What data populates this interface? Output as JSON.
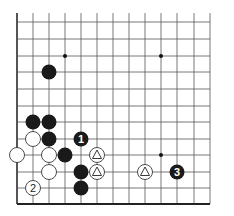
{
  "board": {
    "origin_x": 17,
    "origin_y": 22,
    "col_x": [
      17,
      33,
      49,
      65,
      81,
      97,
      113,
      129,
      145,
      161,
      177,
      194,
      210
    ],
    "row_y": [
      22,
      39,
      56,
      72,
      89,
      106,
      122,
      139,
      155,
      172,
      188,
      204
    ],
    "top_y": 13,
    "line_color": "#555555",
    "edge_color": "#222222"
  },
  "hoshi": [
    [
      3,
      2
    ],
    [
      9,
      2
    ],
    [
      9,
      8
    ]
  ],
  "stones": [
    {
      "c": 2,
      "r": 3,
      "color": "black",
      "label": ""
    },
    {
      "c": 1,
      "r": 6,
      "color": "black",
      "label": ""
    },
    {
      "c": 2,
      "r": 6,
      "color": "black",
      "label": ""
    },
    {
      "c": 1,
      "r": 7,
      "color": "white",
      "label": ""
    },
    {
      "c": 2,
      "r": 7,
      "color": "black",
      "label": ""
    },
    {
      "c": 4,
      "r": 7,
      "color": "black",
      "label": "1"
    },
    {
      "c": 0,
      "r": 8,
      "color": "white",
      "label": ""
    },
    {
      "c": 2,
      "r": 8,
      "color": "white",
      "label": ""
    },
    {
      "c": 3,
      "r": 8,
      "color": "black",
      "label": ""
    },
    {
      "c": 5,
      "r": 8,
      "color": "white",
      "label": "triangle"
    },
    {
      "c": 2,
      "r": 9,
      "color": "white",
      "label": ""
    },
    {
      "c": 4,
      "r": 9,
      "color": "black",
      "label": ""
    },
    {
      "c": 5,
      "r": 9,
      "color": "white",
      "label": "triangle"
    },
    {
      "c": 8,
      "r": 9,
      "color": "white",
      "label": "triangle"
    },
    {
      "c": 10,
      "r": 9,
      "color": "black",
      "label": "3"
    },
    {
      "c": 1,
      "r": 10,
      "color": "white",
      "label": "2"
    },
    {
      "c": 4,
      "r": 10,
      "color": "black",
      "label": ""
    }
  ]
}
